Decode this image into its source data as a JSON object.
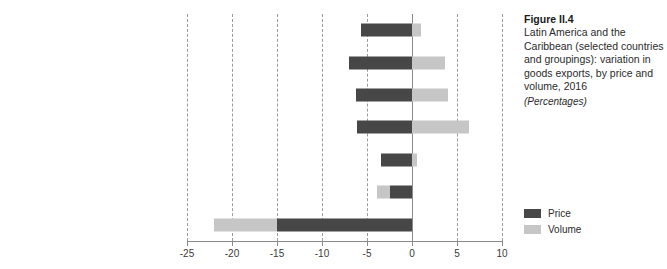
{
  "caption": {
    "figure_number": "Figure II.4",
    "title": "Latin America and the Caribbean (selected countries and groupings): variation in goods exports, by price and volume, 2016",
    "units": "(Percentages)"
  },
  "legend": {
    "position": "right",
    "items": [
      {
        "label": "Price",
        "color": "#474747"
      },
      {
        "label": "Volume",
        "color": "#c6c6c6"
      }
    ]
  },
  "chart_data": {
    "type": "bar",
    "orientation": "horizontal",
    "stacked": true,
    "title": "Latin America and the Caribbean (selected countries and groupings): variation in goods exports, by price and volume, 2016",
    "subtitle": "(Percentages)",
    "xlabel": "",
    "ylabel": "",
    "xlim": [
      -25,
      10
    ],
    "xticks": [
      -25,
      -20,
      -15,
      -10,
      -5,
      0,
      5,
      10
    ],
    "xtick_labels": [
      "-25",
      "-20",
      "-15",
      "-10",
      "-5",
      "0",
      "5",
      "10"
    ],
    "grid": "vertical-dashed",
    "categories": [
      "Latin America",
      "Brazil",
      "Exporters of mining products",
      "Exporters of agro-industrial products",
      "Mexico",
      "Central America, Haiti and Dominican Rep.",
      "Hydrocarbon exporters"
    ],
    "category_labels": [
      {
        "text": "Latin America",
        "superscript": ""
      },
      {
        "text": "Brazil",
        "superscript": ""
      },
      {
        "text": "Exporters of mining products",
        "superscript": "a"
      },
      {
        "text": "Exporters of agro-industrial products",
        "superscript": "b"
      },
      {
        "text": "Mexico",
        "superscript": ""
      },
      {
        "text": "Central America, Haiti and Dominican Rep.",
        "superscript": ""
      },
      {
        "text": "Hydrocarbon exporters",
        "superscript": "c"
      }
    ],
    "series": [
      {
        "name": "Price",
        "color": "#474747",
        "values": [
          -5.7,
          -7.0,
          -6.2,
          -6.1,
          -3.4,
          -2.4,
          -15.0
        ]
      },
      {
        "name": "Volume",
        "color": "#c6c6c6",
        "values": [
          1.0,
          3.7,
          4.0,
          6.3,
          0.6,
          -1.5,
          -7.0
        ]
      }
    ]
  }
}
